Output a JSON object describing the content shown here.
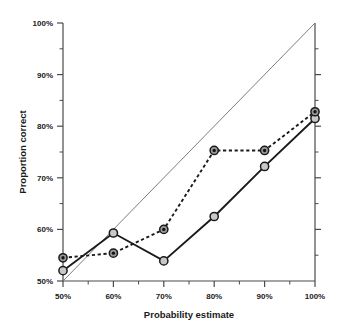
{
  "chart_data": {
    "type": "line",
    "title": "",
    "xlabel": "Probability estimate",
    "ylabel": "Proportion correct",
    "categories": [
      "50%",
      "60%",
      "70%",
      "80%",
      "90%",
      "100%"
    ],
    "x": [
      50,
      60,
      70,
      80,
      90,
      100
    ],
    "xlim": [
      50,
      100
    ],
    "ylim": [
      50,
      100
    ],
    "xticks": [
      "50%",
      "60%",
      "70%",
      "80%",
      "90%",
      "100%"
    ],
    "yticks": [
      "50%",
      "60%",
      "70%",
      "80%",
      "90%",
      "100%"
    ],
    "ytick_values": [
      50,
      60,
      70,
      80,
      90,
      100
    ],
    "grid": false,
    "minor_ticks": true,
    "legend": "none",
    "reference_line": {
      "label": "perfect calibration diagonal",
      "from": [
        50,
        50
      ],
      "to": [
        100,
        100
      ],
      "style": "thin solid"
    },
    "series": [
      {
        "name": "dashed-filled-series",
        "style": "dashed",
        "marker": "filled-circle",
        "color": "#1a1a1a",
        "values": [
          54.5,
          55.4,
          60.0,
          75.3,
          75.3,
          82.8
        ]
      },
      {
        "name": "solid-open-series",
        "style": "solid",
        "marker": "open-circle",
        "color": "#1a1a1a",
        "values": [
          52.0,
          59.3,
          53.9,
          62.5,
          72.2,
          81.5
        ]
      }
    ]
  },
  "colors": {
    "axis": "#3a3a3a",
    "line": "#1a1a1a",
    "marker_fill_open": "#cccccc",
    "marker_fill_solid": "#2b2b2b",
    "reference": "#666666",
    "background": "#ffffff"
  },
  "axes": {
    "x_title": "Probability estimate",
    "y_title": "Proportion correct"
  },
  "clipped_header": ""
}
